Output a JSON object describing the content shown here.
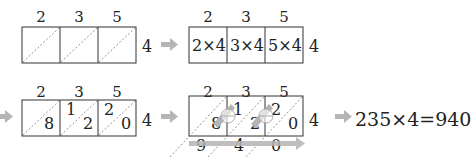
{
  "step1": {
    "top_digits": [
      "2",
      "3",
      "5"
    ],
    "multiplier": "4"
  },
  "step2": {
    "top_digits": [
      "2",
      "3",
      "5"
    ],
    "cells": [
      "2×4",
      "3×4",
      "5×4"
    ],
    "multiplier": "4"
  },
  "step3": {
    "top_digits": [
      "2",
      "3",
      "5"
    ],
    "cells": [
      {
        "tens": "",
        "ones": "8"
      },
      {
        "tens": "1",
        "ones": "2"
      },
      {
        "tens": "2",
        "ones": "0"
      }
    ],
    "multiplier": "4"
  },
  "step4": {
    "top_digits": [
      "2",
      "3",
      "5"
    ],
    "cells": [
      {
        "tens": "",
        "ones": "8"
      },
      {
        "tens": "1",
        "ones": "2"
      },
      {
        "tens": "2",
        "ones": "0"
      }
    ],
    "multiplier": "4",
    "plus_symbol": "⊕",
    "result_digits": [
      "9",
      "4",
      "0"
    ]
  },
  "result": {
    "equation": "235×4=940"
  },
  "colors": {
    "arrow": "#b5b5b5",
    "line": "#333333",
    "diagonal": "#777777"
  }
}
